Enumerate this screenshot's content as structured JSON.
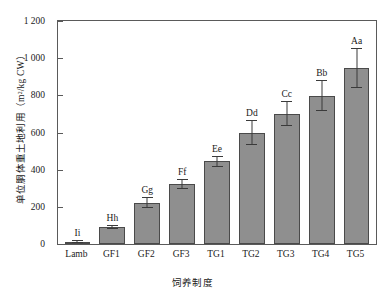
{
  "chart_data": {
    "type": "bar",
    "title": "",
    "xlabel": "饲养制度",
    "ylabel": "单位胴体重土地利用（m²/kg CW）",
    "ylabel_text": "单位胴体重土地利用",
    "ylabel_unit": "（m²/kg CW）",
    "categories": [
      "Lamb",
      "GF1",
      "GF2",
      "GF3",
      "TG1",
      "TG2",
      "TG3",
      "TG4",
      "TG5"
    ],
    "values": [
      12,
      90,
      223,
      322,
      445,
      600,
      702,
      798,
      948
    ],
    "errors": [
      8,
      10,
      28,
      26,
      28,
      68,
      68,
      82,
      108
    ],
    "annotations": [
      "Ii",
      "Hh",
      "Gg",
      "Ff",
      "Ee",
      "Dd",
      "Cc",
      "Bb",
      "Aa"
    ],
    "ylim": [
      0,
      1200
    ],
    "yticks": [
      0,
      200,
      400,
      600,
      800,
      1000,
      1200
    ],
    "ytick_labels": [
      "0",
      "200",
      "400",
      "600",
      "800",
      "1 000",
      "1 200"
    ],
    "grid": false,
    "legend": "none",
    "series": [
      {
        "name": "单位胴体重土地利用",
        "values": [
          12,
          90,
          223,
          322,
          445,
          600,
          702,
          798,
          948
        ]
      }
    ]
  },
  "style": {
    "bar_fill": "#8f8f8f",
    "bar_edge": "#4a4a4a",
    "axis_color": "#5a5a5a",
    "text_color": "#1a1a1a",
    "background": "#ffffff"
  }
}
